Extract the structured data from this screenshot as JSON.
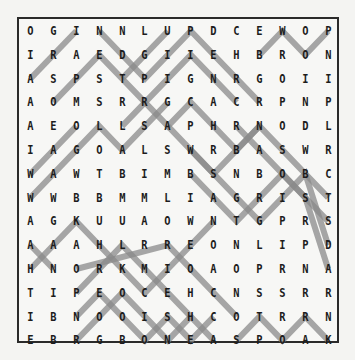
{
  "puzzle": {
    "type": "word-search",
    "rows": [
      [
        "O",
        "G",
        "I",
        "N",
        "N",
        "L",
        "U",
        "P",
        "D",
        "C",
        "E",
        "W",
        "O",
        "P"
      ],
      [
        "I",
        "R",
        "A",
        "E",
        "D",
        "G",
        "I",
        "I",
        "E",
        "H",
        "B",
        "R",
        "O",
        "N"
      ],
      [
        "A",
        "S",
        "P",
        "S",
        "T",
        "P",
        "I",
        "G",
        "N",
        "R",
        "G",
        "O",
        "I",
        "I"
      ],
      [
        "A",
        "O",
        "M",
        "S",
        "R",
        "R",
        "G",
        "C",
        "A",
        "C",
        "R",
        "P",
        "N",
        "P"
      ],
      [
        "A",
        "E",
        "O",
        "L",
        "L",
        "S",
        "A",
        "P",
        "H",
        "R",
        "N",
        "O",
        "D",
        "L"
      ],
      [
        "I",
        "A",
        "G",
        "O",
        "A",
        "L",
        "S",
        "W",
        "R",
        "B",
        "A",
        "S",
        "W",
        "R"
      ],
      [
        "W",
        "A",
        "W",
        "T",
        "B",
        "I",
        "M",
        "B",
        "S",
        "N",
        "B",
        "O",
        "B",
        "C"
      ],
      [
        "W",
        "W",
        "B",
        "B",
        "M",
        "M",
        "L",
        "I",
        "A",
        "G",
        "R",
        "I",
        "S",
        "T"
      ],
      [
        "A",
        "G",
        "K",
        "U",
        "U",
        "A",
        "O",
        "W",
        "N",
        "T",
        "G",
        "P",
        "R",
        "S"
      ],
      [
        "A",
        "A",
        "A",
        "H",
        "L",
        "R",
        "R",
        "E",
        "O",
        "N",
        "L",
        "I",
        "P",
        "D"
      ],
      [
        "H",
        "N",
        "O",
        "R",
        "K",
        "M",
        "I",
        "O",
        "A",
        "O",
        "P",
        "R",
        "N",
        "A"
      ],
      [
        "T",
        "I",
        "P",
        "E",
        "O",
        "C",
        "E",
        "H",
        "C",
        "N",
        "S",
        "S",
        "R",
        "R"
      ],
      [
        "I",
        "B",
        "N",
        "O",
        "O",
        "I",
        "S",
        "H",
        "C",
        "O",
        "T",
        "R",
        "R",
        "N"
      ],
      [
        "E",
        "B",
        "R",
        "G",
        "B",
        "O",
        "N",
        "E",
        "A",
        "S",
        "P",
        "O",
        "A",
        "K"
      ]
    ],
    "highlight_color": "#8a8a8a",
    "highlight_paths": [
      [
        [
          2,
          0
        ],
        [
          0,
          2
        ]
      ],
      [
        [
          3,
          1
        ],
        [
          1,
          3
        ],
        [
          3,
          5
        ],
        [
          1,
          7
        ],
        [
          3,
          9
        ]
      ],
      [
        [
          0,
          3
        ],
        [
          2,
          5
        ],
        [
          0,
          7
        ],
        [
          3,
          10
        ]
      ],
      [
        [
          1,
          10
        ],
        [
          0,
          11
        ],
        [
          1,
          12
        ],
        [
          0,
          13
        ]
      ],
      [
        [
          2,
          4
        ],
        [
          0,
          6
        ]
      ],
      [
        [
          4,
          4
        ],
        [
          3,
          5
        ],
        [
          4,
          6
        ],
        [
          3,
          7
        ],
        [
          5,
          9
        ],
        [
          4,
          10
        ],
        [
          7,
          13
        ]
      ],
      [
        [
          4,
          6
        ],
        [
          6,
          8
        ],
        [
          4,
          10
        ]
      ],
      [
        [
          6,
          0
        ],
        [
          5,
          1
        ],
        [
          4,
          2
        ]
      ],
      [
        [
          7,
          0
        ],
        [
          4,
          3
        ],
        [
          5,
          4
        ],
        [
          3,
          6
        ]
      ],
      [
        [
          5,
          7
        ],
        [
          8,
          10
        ],
        [
          6,
          12
        ],
        [
          9,
          13
        ]
      ],
      [
        [
          6,
          7
        ],
        [
          8,
          9
        ],
        [
          6,
          11
        ],
        [
          8,
          13
        ]
      ],
      [
        [
          4,
          9
        ],
        [
          7,
          12
        ],
        [
          10,
          13
        ]
      ],
      [
        [
          10,
          0
        ],
        [
          8,
          2
        ],
        [
          10,
          4
        ],
        [
          11,
          5
        ],
        [
          10,
          6
        ],
        [
          9,
          7
        ],
        [
          8,
          8
        ]
      ],
      [
        [
          10,
          2
        ],
        [
          9,
          6
        ],
        [
          11,
          8
        ],
        [
          12,
          9
        ]
      ],
      [
        [
          11,
          2
        ],
        [
          9,
          4
        ],
        [
          10,
          5
        ],
        [
          12,
          7
        ],
        [
          13,
          8
        ]
      ],
      [
        [
          12,
          2
        ],
        [
          11,
          3
        ],
        [
          13,
          5
        ],
        [
          12,
          6
        ],
        [
          13,
          7
        ],
        [
          12,
          8
        ]
      ],
      [
        [
          13,
          2
        ],
        [
          11,
          4
        ],
        [
          13,
          6
        ],
        [
          12,
          7
        ]
      ],
      [
        [
          13,
          9
        ],
        [
          12,
          10
        ],
        [
          13,
          11
        ],
        [
          12,
          12
        ],
        [
          13,
          13
        ]
      ],
      [
        [
          9,
          0
        ],
        [
          10,
          1
        ]
      ]
    ]
  }
}
